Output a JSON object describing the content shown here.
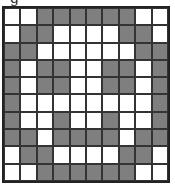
{
  "caption": "g",
  "colors": {
    "filled": "#7f7f7f",
    "empty": "#ffffff",
    "line": "#333333"
  },
  "grid": {
    "rows": 10,
    "cols": 10,
    "cells": [
      "WWGGGGGGWW",
      "WGGWWWWGGW",
      "GGWWWWWWGG",
      "GWGGWWGGWG",
      "GWGGWWGGWG",
      "GWWWWWWWWG",
      "GWWGWWGWWG",
      "GGWGGGGWGG",
      "WGGWWWWGGW",
      "WWGGGGGGWW"
    ]
  }
}
